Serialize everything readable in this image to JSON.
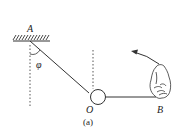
{
  "diagram": {
    "labels": {
      "pivot": "A",
      "ball": "O",
      "hand_point": "B",
      "angle": "φ",
      "caption": "(a)"
    },
    "colors": {
      "stroke": "#333333",
      "background": "#ffffff"
    }
  }
}
